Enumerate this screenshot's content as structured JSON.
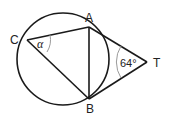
{
  "diagram": {
    "points": {
      "A": {
        "label": "A",
        "x": 89,
        "y": 27
      },
      "B": {
        "label": "B",
        "x": 89,
        "y": 99
      },
      "C": {
        "label": "C",
        "x": 27,
        "y": 40
      },
      "T": {
        "label": "T",
        "x": 147,
        "y": 62
      }
    },
    "circle": {
      "cx": 63,
      "cy": 59,
      "r": 46
    },
    "angles": {
      "at_C": {
        "label": "α",
        "vertex": "C"
      },
      "at_T": {
        "label": "64°",
        "vertex": "T"
      }
    },
    "segments": [
      "CA",
      "CB",
      "AB",
      "AT",
      "BT"
    ],
    "colors": {
      "line": "#1a1a1a",
      "arc": "#9a9a9a",
      "text": "#222222"
    }
  }
}
